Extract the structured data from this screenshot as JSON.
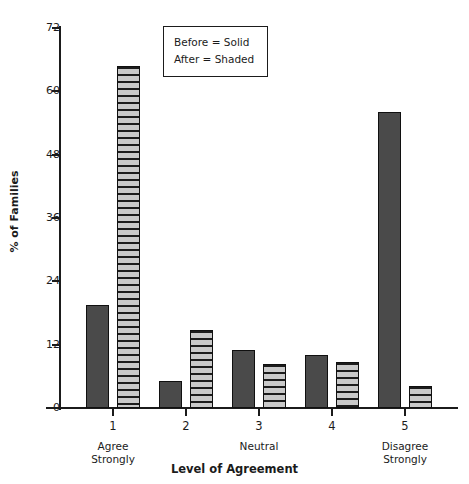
{
  "chart_data": {
    "type": "bar",
    "title": "",
    "xlabel": "Level of Agreement",
    "ylabel": "% of Families",
    "categories": [
      "1",
      "2",
      "3",
      "4",
      "5"
    ],
    "category_captions": [
      "Agree\nStrongly",
      "",
      "Neutral",
      "",
      "Disagree\nStrongly"
    ],
    "series": [
      {
        "name": "Before",
        "style": "Solid",
        "values": [
          19.5,
          5.1,
          11.0,
          10.0,
          56.0
        ]
      },
      {
        "name": "After",
        "style": "Shaded",
        "values": [
          64.8,
          14.8,
          8.3,
          8.7,
          4.2
        ]
      }
    ],
    "ylim": [
      0,
      72
    ],
    "yticks": [
      0,
      12,
      24,
      36,
      48,
      60,
      72
    ],
    "ytick_labels": [
      "0",
      "12",
      "24",
      "36",
      "48",
      "60",
      "72"
    ],
    "grid": false,
    "legend_position": "top-center",
    "colors": {
      "solid_fill": "#4a4a4a",
      "shaded_light": "#c9c9c9",
      "shaded_dark": "#1c1c1c",
      "axis": "#1b1b1b",
      "background": "#ffffff"
    }
  },
  "legend": {
    "rows": [
      "Before  =  Solid",
      "After  =  Shaded"
    ]
  }
}
